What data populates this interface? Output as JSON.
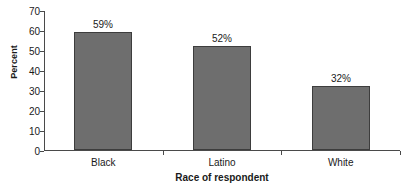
{
  "chart_data": {
    "type": "bar",
    "title": "",
    "categories": [
      "Black",
      "Latino",
      "White"
    ],
    "values": [
      59,
      52,
      32
    ],
    "value_labels": [
      "59%",
      "52%",
      "32%"
    ],
    "xlabel": "Race of respondent",
    "ylabel": "Percent",
    "ylim": [
      0,
      70
    ],
    "ytick_step": 10,
    "yticks": [
      0,
      10,
      20,
      30,
      40,
      50,
      60,
      70
    ],
    "ytick_labels": [
      "0",
      "10",
      "20",
      "30",
      "40",
      "50",
      "60",
      "70"
    ],
    "grid": false,
    "legend": false,
    "legend_position": "none",
    "bar_color": "#6e6e6e",
    "bar_edge_color": "#3d3d3d",
    "axis_color": "#4a4a4a",
    "background_color": "#ffffff"
  }
}
